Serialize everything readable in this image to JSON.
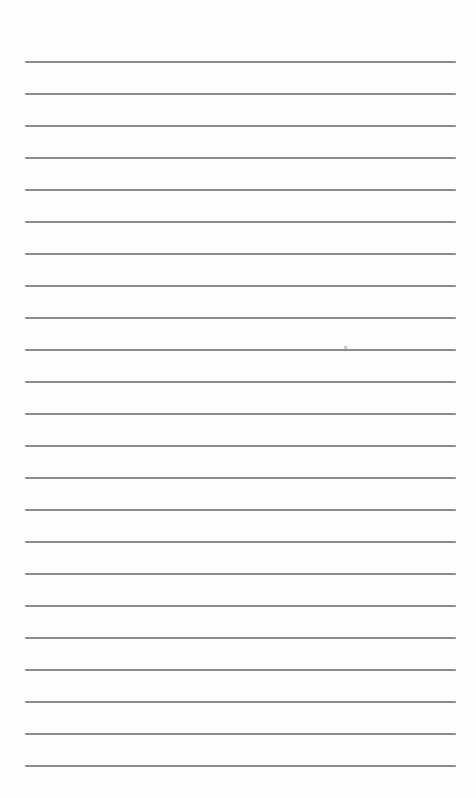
{
  "page": {
    "type": "lined-notebook-page",
    "background_color": "#fefefe",
    "rule_color": "#8c8c8c",
    "rule_count": 23,
    "rule_start_y": 61,
    "rule_spacing": 32,
    "rule_left": 25,
    "rule_right": 456,
    "text": ""
  }
}
